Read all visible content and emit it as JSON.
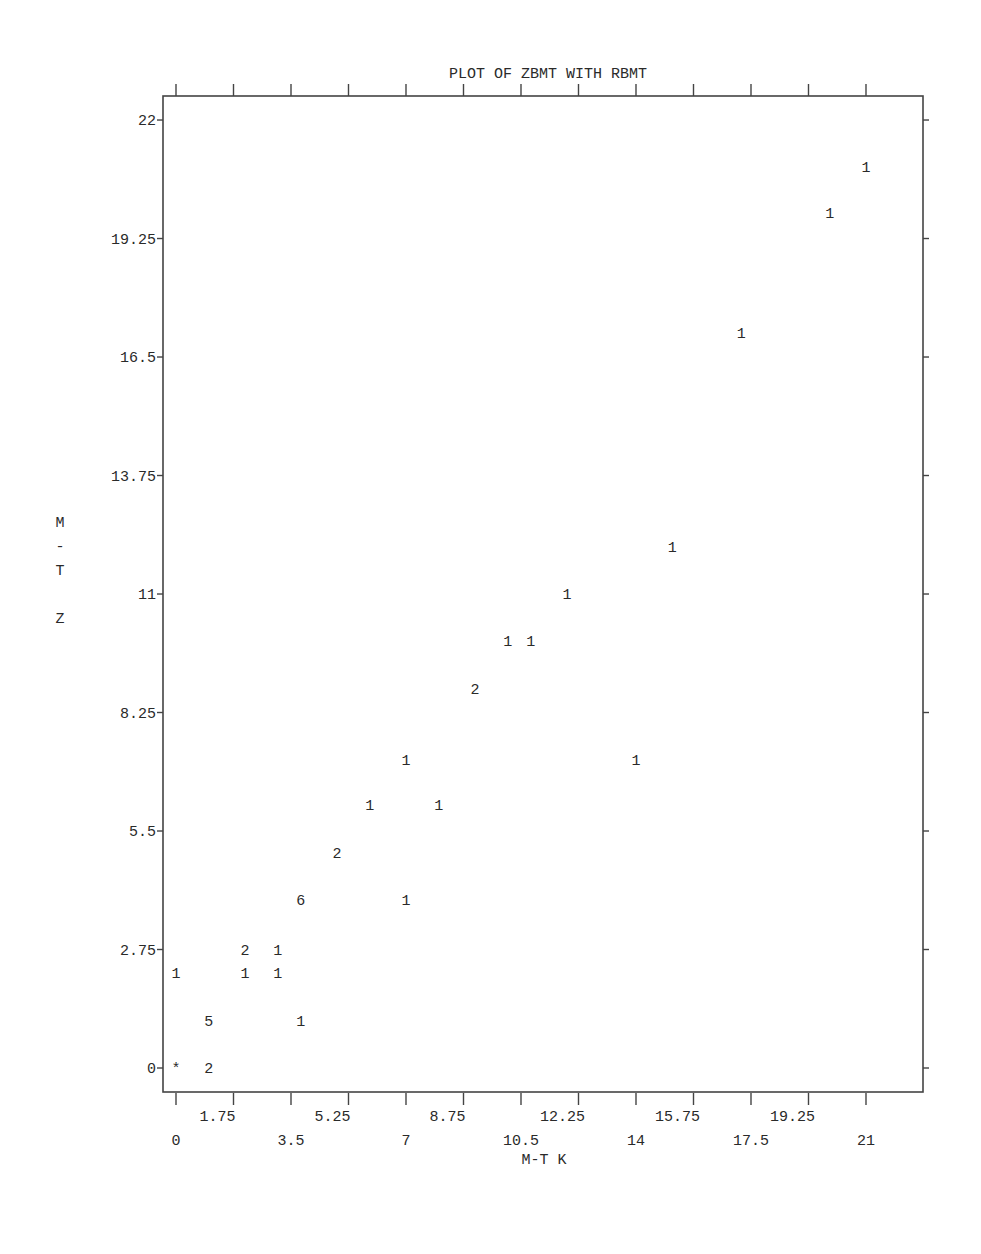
{
  "chart_data": {
    "type": "scatter",
    "title": "PLOT OF ZBMT WITH RBMT",
    "xlabel": "M-T K",
    "ylabel": "M - T Z",
    "ylabel_lines": [
      "M",
      "-",
      "T",
      "",
      "Z"
    ],
    "xlim": [
      -0.35,
      22.8
    ],
    "ylim": [
      -0.55,
      22.55
    ],
    "x_ticks": [
      {
        "value": 0,
        "label": "0",
        "row": 2
      },
      {
        "value": 1.75,
        "label": "1.75",
        "row": 1
      },
      {
        "value": 3.5,
        "label": "3.5",
        "row": 2
      },
      {
        "value": 5.25,
        "label": "5.25",
        "row": 1
      },
      {
        "value": 7,
        "label": "7",
        "row": 2
      },
      {
        "value": 8.75,
        "label": "8.75",
        "row": 1
      },
      {
        "value": 10.5,
        "label": "10.5",
        "row": 2
      },
      {
        "value": 12.25,
        "label": "12.25",
        "row": 1
      },
      {
        "value": 14,
        "label": "14",
        "row": 2
      },
      {
        "value": 15.75,
        "label": "15.75",
        "row": 1
      },
      {
        "value": 17.5,
        "label": "17.5",
        "row": 2
      },
      {
        "value": 19.25,
        "label": "19.25",
        "row": 1
      },
      {
        "value": 21,
        "label": "21",
        "row": 2
      }
    ],
    "y_ticks": [
      {
        "value": 0,
        "label": "0"
      },
      {
        "value": 2.75,
        "label": "2.75"
      },
      {
        "value": 5.5,
        "label": "5.5"
      },
      {
        "value": 8.25,
        "label": "8.25"
      },
      {
        "value": 11,
        "label": "11"
      },
      {
        "value": 13.75,
        "label": "13.75"
      },
      {
        "value": 16.5,
        "label": "16.5"
      },
      {
        "value": 19.25,
        "label": "19.25"
      },
      {
        "value": 22,
        "label": "22"
      }
    ],
    "marker_note": "Symbols are counts of observations at each position; * marks multiple overlapping observations",
    "points": [
      {
        "x": 0,
        "y": 0,
        "symbol": "*"
      },
      {
        "x": 1,
        "y": 0,
        "symbol": "2"
      },
      {
        "x": 1,
        "y": 1.1,
        "symbol": "5"
      },
      {
        "x": 3.8,
        "y": 1.1,
        "symbol": "1"
      },
      {
        "x": 0,
        "y": 2.2,
        "symbol": "1"
      },
      {
        "x": 2.1,
        "y": 2.2,
        "symbol": "1"
      },
      {
        "x": 3.1,
        "y": 2.2,
        "symbol": "1"
      },
      {
        "x": 2.1,
        "y": 2.75,
        "symbol": "2"
      },
      {
        "x": 3.1,
        "y": 2.75,
        "symbol": "1"
      },
      {
        "x": 3.8,
        "y": 3.9,
        "symbol": "6"
      },
      {
        "x": 7,
        "y": 3.9,
        "symbol": "1"
      },
      {
        "x": 4.9,
        "y": 5,
        "symbol": "2"
      },
      {
        "x": 5.9,
        "y": 6.1,
        "symbol": "1"
      },
      {
        "x": 8,
        "y": 6.1,
        "symbol": "1"
      },
      {
        "x": 7,
        "y": 7.15,
        "symbol": "1"
      },
      {
        "x": 14,
        "y": 7.15,
        "symbol": "1"
      },
      {
        "x": 9.1,
        "y": 8.8,
        "symbol": "2"
      },
      {
        "x": 10.1,
        "y": 9.9,
        "symbol": "1"
      },
      {
        "x": 10.8,
        "y": 9.9,
        "symbol": "1"
      },
      {
        "x": 11.9,
        "y": 11,
        "symbol": "1"
      },
      {
        "x": 15.1,
        "y": 12.1,
        "symbol": "1"
      },
      {
        "x": 17.2,
        "y": 17.05,
        "symbol": "1"
      },
      {
        "x": 19.9,
        "y": 19.85,
        "symbol": "1"
      },
      {
        "x": 21,
        "y": 20.9,
        "symbol": "1"
      }
    ],
    "grid": false,
    "legend": null
  },
  "colors": {
    "ink": "#2a2a2a",
    "background": "#ffffff"
  }
}
